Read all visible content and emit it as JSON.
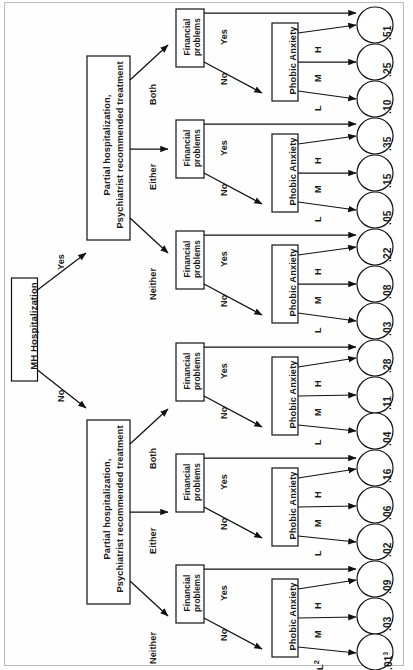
{
  "diagram": {
    "type": "decision-tree",
    "orientation": "rotated-90-counterclockwise",
    "root": {
      "label": "MH Hospitalization"
    },
    "level1_label": "Partial hospitalization,\nPsychiatrist recommended treatment",
    "level1_line1": "Partial hospitalization,",
    "level1_line2": "Psychiatrist recommended treatment",
    "financial_label_line1": "Financial",
    "financial_label_line2": "problems",
    "phobic_label": "Phobic Anxiety",
    "edges": {
      "root_yes": "Yes",
      "root_no": "No",
      "both": "Both",
      "either": "Either",
      "neither": "Neither",
      "fin_yes": "Yes",
      "fin_no": "No",
      "anx_high": "H",
      "anx_med": "M",
      "anx_low": "L",
      "anx_low_note": "L2"
    },
    "branches": [
      {
        "hospitalization": "Yes",
        "treatment": "Both",
        "financial_yes": ".51",
        "anxiety": [
          ".25",
          ".10"
        ]
      },
      {
        "hospitalization": "Yes",
        "treatment": "Either",
        "financial_yes": ".35",
        "anxiety": [
          ".15",
          ".05"
        ]
      },
      {
        "hospitalization": "Yes",
        "treatment": "Neither",
        "financial_yes": ".22",
        "anxiety": [
          ".08",
          ".03"
        ]
      },
      {
        "hospitalization": "No",
        "treatment": "Both",
        "financial_yes": ".28",
        "anxiety": [
          ".11",
          ".04"
        ]
      },
      {
        "hospitalization": "No",
        "treatment": "Either",
        "financial_yes": ".16",
        "anxiety": [
          ".06",
          ".02"
        ]
      },
      {
        "hospitalization": "No",
        "treatment": "Neither",
        "financial_yes": ".09",
        "anxiety": [
          ".03",
          ".01"
        ]
      }
    ],
    "leaves": [
      {
        "value": ".51",
        "sup": ""
      },
      {
        "value": ".25",
        "sup": ""
      },
      {
        "value": ".10",
        "sup": ""
      },
      {
        "value": ".35",
        "sup": ""
      },
      {
        "value": ".15",
        "sup": ""
      },
      {
        "value": ".05",
        "sup": ""
      },
      {
        "value": ".22",
        "sup": ""
      },
      {
        "value": ".08",
        "sup": ""
      },
      {
        "value": ".03",
        "sup": ""
      },
      {
        "value": ".28",
        "sup": ""
      },
      {
        "value": ".11",
        "sup": ""
      },
      {
        "value": ".04",
        "sup": ""
      },
      {
        "value": ".16",
        "sup": ""
      },
      {
        "value": ".06",
        "sup": ""
      },
      {
        "value": ".02",
        "sup": ""
      },
      {
        "value": ".09",
        "sup": ""
      },
      {
        "value": ".03",
        "sup": ""
      },
      {
        "value": ".01",
        "sup": "3"
      }
    ],
    "anxiety_low_labels": [
      "L",
      "L",
      "L",
      "L",
      "L",
      "L2"
    ]
  }
}
